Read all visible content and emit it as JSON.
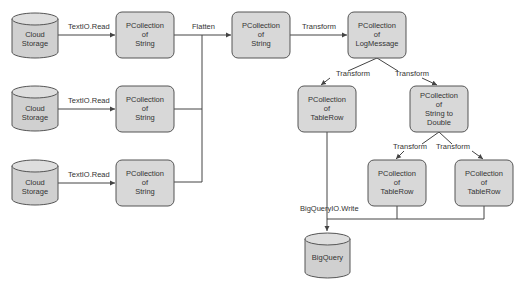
{
  "diagram": {
    "nodes": {
      "cloud_storage_1": {
        "line1": "Cloud",
        "line2": "Storage"
      },
      "cloud_storage_2": {
        "line1": "Cloud",
        "line2": "Storage"
      },
      "cloud_storage_3": {
        "line1": "Cloud",
        "line2": "Storage"
      },
      "pcoll_string_1": {
        "line1": "PCollection",
        "line2": "of",
        "line3": "String"
      },
      "pcoll_string_2": {
        "line1": "PCollection",
        "line2": "of",
        "line3": "String"
      },
      "pcoll_string_3": {
        "line1": "PCollection",
        "line2": "of",
        "line3": "String"
      },
      "pcoll_string_flat": {
        "line1": "PCollection",
        "line2": "of",
        "line3": "String"
      },
      "pcoll_logmessage": {
        "line1": "PCollection",
        "line2": "of",
        "line3": "LogMessage"
      },
      "pcoll_tablerow_left": {
        "line1": "PCollection",
        "line2": "of",
        "line3": "TableRow"
      },
      "pcoll_string_to_double": {
        "line1": "PCollection",
        "line2": "of",
        "line3": "String to",
        "line4": "Double"
      },
      "pcoll_tablerow_mid": {
        "line1": "PCollection",
        "line2": "of",
        "line3": "TableRow"
      },
      "pcoll_tablerow_right": {
        "line1": "PCollection",
        "line2": "of",
        "line3": "TableRow"
      },
      "bigquery": {
        "line1": "BigQuery"
      }
    },
    "edges": {
      "read_1": "TextIO.Read",
      "read_2": "TextIO.Read",
      "read_3": "TextIO.Read",
      "flatten": "Flatten",
      "transform_to_logmessage": "Transform",
      "transform_to_tablerow": "Transform",
      "transform_to_string_double": "Transform",
      "transform_to_tablerow_mid": "Transform",
      "transform_to_tablerow_right": "Transform",
      "bigquery_write": "BigQueryIO.Write"
    },
    "colors": {
      "node_fill": "#d8d8d8",
      "node_stroke": "#555555",
      "edge": "#444444",
      "text": "#333333"
    }
  }
}
